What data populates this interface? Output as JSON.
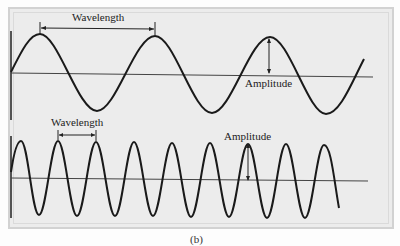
{
  "figure": {
    "caption": "(b)",
    "top_wave": {
      "wavelength_label": "Wavelength",
      "amplitude_label": "Amplitude",
      "description": "Long wavelength sine wave"
    },
    "bottom_wave": {
      "wavelength_label": "Wavelength",
      "amplitude_label": "Amplitude",
      "description": "Short wavelength sine wave"
    },
    "colors": {
      "background": "#ececec",
      "wave": "#1a1a1a",
      "axis": "#444444"
    }
  }
}
